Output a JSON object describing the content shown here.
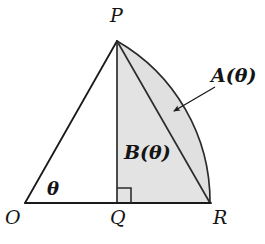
{
  "figure": {
    "type": "geometry-diagram",
    "width": 265,
    "height": 244,
    "background_color": "#ffffff",
    "stroke_color": "#1a1a1a",
    "fill_color": "#e3e3e3",
    "fill_color_segment": "#e0e0e0"
  },
  "vertices": {
    "O": {
      "label": "O",
      "x": 25,
      "y": 203,
      "label_x": 5,
      "label_y": 208
    },
    "P": {
      "label": "P",
      "x": 117,
      "y": 41,
      "label_x": 110,
      "label_y": 6
    },
    "Q": {
      "label": "Q",
      "x": 117,
      "y": 203,
      "label_x": 110,
      "label_y": 208
    },
    "R": {
      "label": "R",
      "x": 210,
      "y": 203,
      "label_x": 213,
      "label_y": 208
    }
  },
  "regions": {
    "A": {
      "label": "A(θ)",
      "label_x": 211,
      "label_y": 66,
      "description": "circular segment between chord PR and arc PR"
    },
    "B": {
      "label": "B(θ)",
      "label_x": 124,
      "label_y": 143,
      "description": "triangle PQR"
    }
  },
  "angle": {
    "label": "θ",
    "label_x": 47,
    "label_y": 180,
    "at_vertex": "O",
    "description": "angle POQ at origin between OR and OP"
  },
  "right_angle": {
    "at_vertex": "Q",
    "marker_size": 14,
    "description": "right angle marker at Q between QP and QR"
  },
  "leader_arrow": {
    "from_x": 215,
    "from_y": 88,
    "to_x": 171,
    "to_y": 113,
    "points_to": "A"
  },
  "arc": {
    "center_x": 25,
    "center_y": 203,
    "radius": 185,
    "from": "P",
    "to": "R",
    "description": "arc of circle centered at O from P to R"
  }
}
